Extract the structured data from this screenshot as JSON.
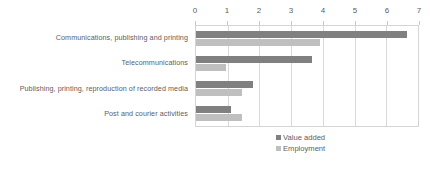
{
  "chart_data": {
    "type": "bar",
    "orientation": "horizontal",
    "title": "",
    "subtitle": "",
    "xlabel": "",
    "ylabel": "",
    "xlim": [
      0,
      7
    ],
    "xticks": [
      0,
      1,
      2,
      3,
      4,
      5,
      6,
      7
    ],
    "xtick_labels": [
      "0",
      "1",
      "2",
      "3",
      "4",
      "5",
      "6",
      "7"
    ],
    "grid": "vertical",
    "legend_position": "bottom",
    "categories": [
      "Communications, publishing and printing",
      "Telecommunications",
      "Publishing, printing, reproduction of recorded media",
      "Post and courier activities"
    ],
    "series": [
      {
        "name": "Value added",
        "color": "#808080",
        "values": [
          6.65,
          3.65,
          1.8,
          1.1
        ]
      },
      {
        "name": "Employment",
        "color": "#bfbfbf",
        "values": [
          3.9,
          0.95,
          1.45,
          1.45
        ]
      }
    ]
  },
  "colors": {
    "series_value_added": "#808080",
    "series_employment": "#bfbfbf",
    "text": "#5e5e5e",
    "gridline": "#d9d9d9",
    "plot_border": "#d4d4d4",
    "background": "#ffffff"
  }
}
